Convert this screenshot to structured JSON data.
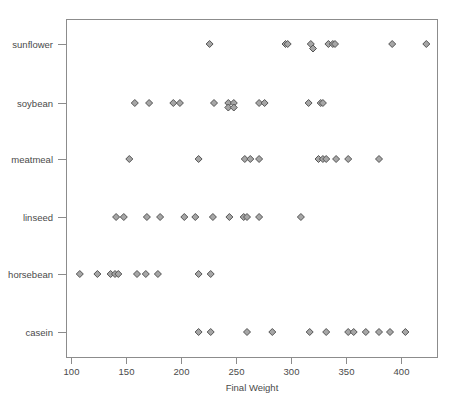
{
  "chart_data": {
    "type": "scatter",
    "title": "",
    "subtitle": "",
    "xlabel": "Final Weight",
    "ylabel": "",
    "xlim": [
      95,
      430
    ],
    "ylim": [
      0,
      7
    ],
    "grid": false,
    "legend": null,
    "orientation": "horizontal-strip",
    "x_ticks": [
      100,
      150,
      200,
      250,
      300,
      350,
      400
    ],
    "x_tick_labels": [
      "100",
      "150",
      "200",
      "250",
      "300",
      "350",
      "400"
    ],
    "y_ticks": [
      1,
      2,
      3,
      4,
      5,
      6
    ],
    "y_tick_labels": [
      "casein",
      "horsebean",
      "linseed",
      "meatmeal",
      "soybean",
      "sunflower"
    ],
    "marker": {
      "shape": "diamond",
      "fill_color": "#a6a6a6",
      "edge_color": "#555555",
      "size_px": 7
    },
    "colors": {
      "frame": "#8c8c8c",
      "text": "#4a4a4a",
      "background": "#ffffff"
    },
    "series": [
      {
        "name": "sunflower",
        "category_index": 6,
        "values": [
          226,
          295,
          297,
          318,
          320,
          334,
          338,
          340,
          392,
          423
        ]
      },
      {
        "name": "soybean",
        "category_index": 5,
        "values": [
          158,
          171,
          193,
          199,
          230,
          243,
          248,
          248,
          271,
          276,
          316,
          327,
          329,
          243
        ]
      },
      {
        "name": "meatmeal",
        "category_index": 4,
        "values": [
          153,
          216,
          258,
          263,
          271,
          325,
          329,
          332,
          341,
          352,
          380
        ]
      },
      {
        "name": "linseed",
        "category_index": 3,
        "values": [
          141,
          148,
          169,
          181,
          203,
          213,
          229,
          244,
          257,
          260,
          271,
          309
        ]
      },
      {
        "name": "horsebean",
        "category_index": 2,
        "values": [
          108,
          124,
          136,
          140,
          143,
          160,
          168,
          179,
          216,
          227
        ]
      },
      {
        "name": "casein",
        "category_index": 1,
        "values": [
          216,
          227,
          260,
          283,
          317,
          332,
          352,
          357,
          368,
          380,
          390,
          404
        ]
      }
    ]
  },
  "axis": {
    "x_title": "Final Weight"
  },
  "geometry": {
    "plot_left": 66,
    "plot_right": 438,
    "plot_top": 19,
    "plot_bottom": 358,
    "x_data_min": 100,
    "x_pixel_min": 71,
    "px_per_unit": 1.1,
    "row_y": {
      "sunflower": 44,
      "soybean": 103,
      "meatmeal": 159,
      "linseed": 217,
      "horsebean": 274,
      "casein": 332
    },
    "x_tick_y_top": 358,
    "x_tick_y_bottom": 364,
    "x_label_y": 375,
    "x_title_y": 391,
    "y_tick_x_left": 58,
    "y_tick_x_right": 66,
    "y_label_x": 53
  }
}
